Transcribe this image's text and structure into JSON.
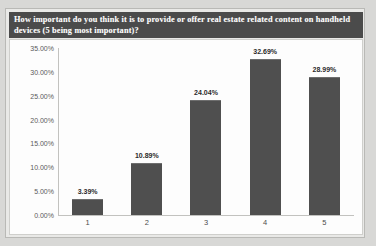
{
  "chart_data": {
    "type": "bar",
    "title": "How important do you think it is to provide or offer real estate related content on handheld devices (5 being most important)?",
    "xlabel": "",
    "ylabel": "",
    "categories": [
      "1",
      "2",
      "3",
      "4",
      "5"
    ],
    "values": [
      3.39,
      10.89,
      24.04,
      32.69,
      28.99
    ],
    "value_labels": [
      "3.39%",
      "10.89%",
      "24.04%",
      "32.69%",
      "28.99%"
    ],
    "ylim": [
      0,
      35
    ],
    "ytick_labels": [
      "35.00%",
      "30.00%",
      "25.00%",
      "20.00%",
      "15.00%",
      "10.00%",
      "5.00%",
      "0.00%"
    ],
    "ytick_values": [
      35,
      30,
      25,
      20,
      15,
      10,
      5,
      0
    ],
    "grid": false,
    "legend": "none",
    "series": [
      {
        "name": "Response share",
        "values": [
          3.39,
          10.89,
          24.04,
          32.69,
          28.99
        ]
      }
    ],
    "colors": {
      "bar_fill": "#4f4f4f",
      "title_background": "#4b4b4b",
      "title_text": "#ffffff",
      "plot_background": "#fdfdfd",
      "figure_background": "#e9e9e7",
      "page_background": "#d8d8d6",
      "axis_line": "#c2c2bf",
      "tick_text": "#5b5b5b"
    }
  }
}
